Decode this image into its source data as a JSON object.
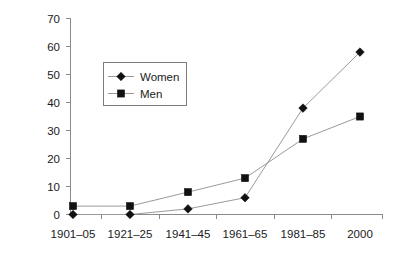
{
  "chart_data": {
    "type": "line",
    "title": "",
    "subtitle": "",
    "xlabel": "",
    "ylabel": "",
    "categories": [
      "1901–05",
      "1921–25",
      "1941–45",
      "1961–65",
      "1981–85",
      "2000"
    ],
    "series": [
      {
        "name": "Women",
        "marker": "diamond",
        "values": [
          0,
          0,
          2,
          6,
          38,
          58
        ]
      },
      {
        "name": "Men",
        "marker": "square",
        "values": [
          3,
          3,
          8,
          13,
          27,
          35
        ]
      }
    ],
    "ylim": [
      0,
      70
    ],
    "y_ticks": [
      0,
      10,
      20,
      30,
      40,
      50,
      60,
      70
    ],
    "y_tick_labels": [
      "0",
      "10",
      "20",
      "30",
      "40",
      "50",
      "60",
      "70"
    ],
    "grid": false,
    "legend": {
      "position": "inside-upper-left",
      "entries": [
        {
          "label": "Women",
          "marker": "diamond"
        },
        {
          "label": "Men",
          "marker": "square"
        }
      ]
    },
    "colors": {
      "line": "#9a9a9a",
      "marker": "#111111",
      "axis": "#8a8a8a",
      "text": "#1a1a1a",
      "legend_border": "#7d7d7d",
      "background": "#ffffff"
    }
  }
}
